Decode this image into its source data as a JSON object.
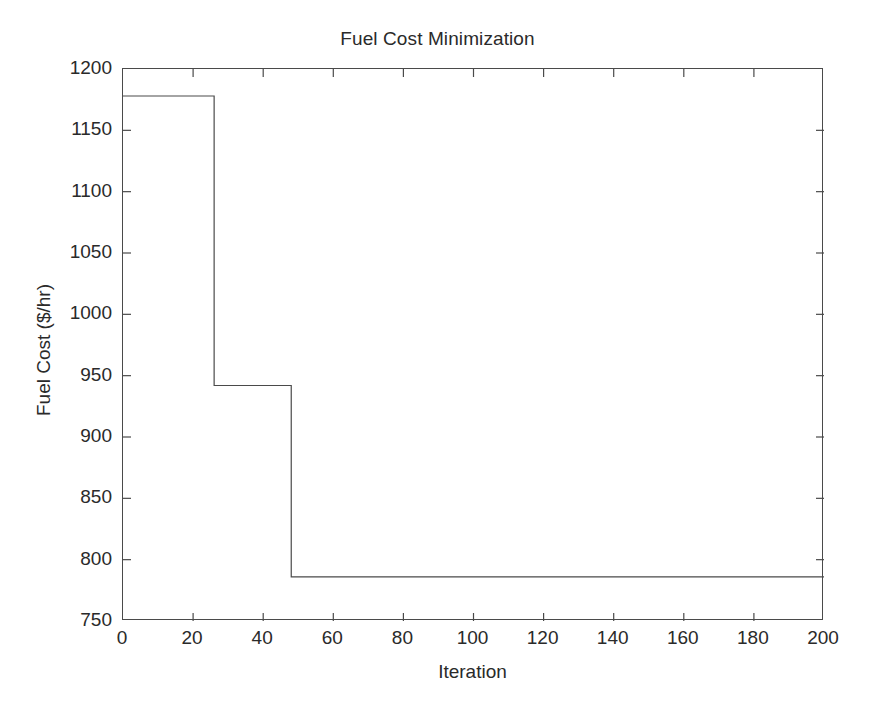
{
  "chart_data": {
    "type": "line",
    "title": "Fuel Cost Minimization",
    "xlabel": "Iteration",
    "ylabel": "Fuel Cost ($/hr)",
    "xlim": [
      0,
      200
    ],
    "ylim": [
      750,
      1200
    ],
    "xticks": [
      0,
      20,
      40,
      60,
      80,
      100,
      120,
      140,
      160,
      180,
      200
    ],
    "yticks": [
      750,
      800,
      850,
      900,
      950,
      1000,
      1050,
      1100,
      1150,
      1200
    ],
    "xtick_labels": [
      "0",
      "20",
      "40",
      "60",
      "80",
      "100",
      "120",
      "140",
      "160",
      "180",
      "200"
    ],
    "ytick_labels": [
      "750",
      "800",
      "850",
      "900",
      "950",
      "1000",
      "1050",
      "1100",
      "1150",
      "1200"
    ],
    "grid": false,
    "legend": false,
    "step_style": "post",
    "line_color": "#4a4a4a",
    "line_width": 1.2,
    "background_color": "#ffffff",
    "axis_color": "#4a4a4a",
    "text_color": "#2a2a2a",
    "series": [
      {
        "name": "Best Fuel Cost",
        "x": [
          0,
          26,
          26,
          48,
          48,
          200
        ],
        "values": [
          1178,
          1178,
          942,
          942,
          786,
          786
        ]
      }
    ],
    "annotations": [],
    "plateaus": [
      {
        "from_iteration": 0,
        "to_iteration": 26,
        "cost": 1178
      },
      {
        "from_iteration": 26,
        "to_iteration": 48,
        "cost": 942
      },
      {
        "from_iteration": 48,
        "to_iteration": 200,
        "cost": 786
      }
    ]
  }
}
